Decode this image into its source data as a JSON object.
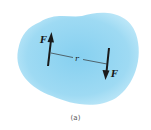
{
  "figure": {
    "caption": "(a)",
    "body_color_center": "#8ad2f0",
    "body_color_edge": "#bfe8f8",
    "force_top_label": "F",
    "force_bottom_label": "F",
    "distance_label": "r",
    "arrow_color": "#1a1a1a"
  }
}
